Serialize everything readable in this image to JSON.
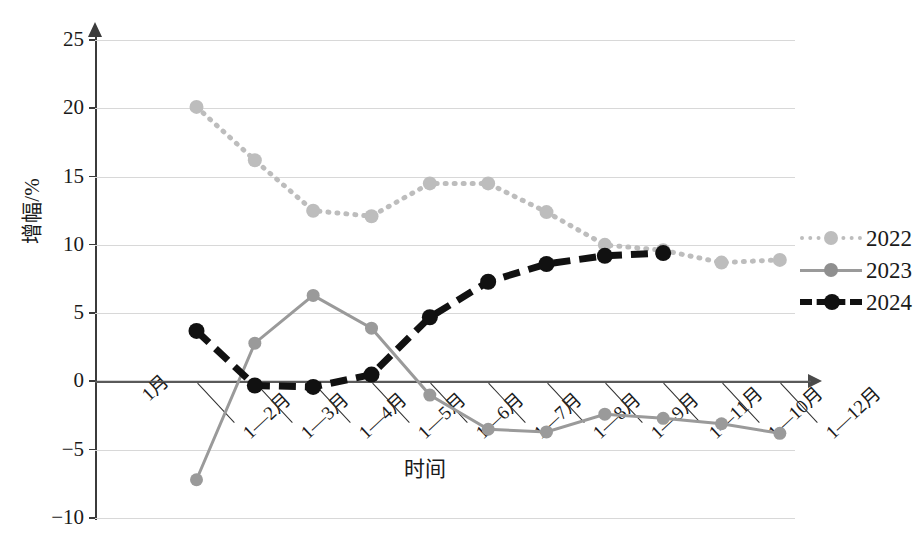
{
  "chart_data": {
    "type": "line",
    "title": "",
    "xlabel": "时间",
    "ylabel": "增幅/%",
    "ylim": [
      -10,
      25
    ],
    "yticks": [
      "25",
      "20",
      "15",
      "10",
      "5",
      "0",
      "−5",
      "−10"
    ],
    "ytick_values": [
      25,
      20,
      15,
      10,
      5,
      0,
      -5,
      -10
    ],
    "grid": true,
    "legend_position": "right",
    "categories": [
      "1月",
      "1—2月",
      "1—3月",
      "1—4月",
      "1—5月",
      "1—6月",
      "1—7月",
      "1—8月",
      "1—9月",
      "1—11月",
      "1—10月",
      "1—12月"
    ],
    "series": [
      {
        "name": "2022",
        "color": "#bdbdbd",
        "style": "dotted",
        "values": [
          null,
          20.1,
          16.2,
          12.5,
          12.1,
          14.5,
          14.5,
          12.4,
          10.0,
          9.6,
          8.7,
          8.9
        ]
      },
      {
        "name": "2023",
        "color": "#9a9a9a",
        "style": "solid",
        "values": [
          null,
          -7.2,
          2.8,
          6.3,
          3.9,
          -1.0,
          -3.5,
          -3.7,
          -2.4,
          -2.7,
          -3.1,
          -3.8
        ]
      },
      {
        "name": "2024",
        "color": "#111111",
        "style": "dashed",
        "values": [
          null,
          3.7,
          -0.3,
          -0.4,
          0.5,
          4.7,
          7.3,
          8.6,
          9.2,
          9.4,
          null,
          null
        ]
      }
    ]
  },
  "legend": {
    "items": [
      {
        "label": "2022"
      },
      {
        "label": "2023"
      },
      {
        "label": "2024"
      }
    ]
  }
}
